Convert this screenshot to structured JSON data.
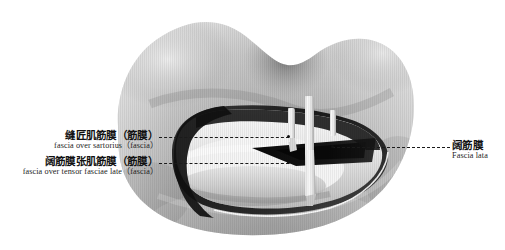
{
  "figure": {
    "type": "anatomical-illustration",
    "style": "grayscale photograph",
    "background_color": "#ffffff",
    "tone_dark": "#1d1d1d",
    "tone_mid": "#9a9a9a",
    "tone_light": "#e8e8e8",
    "retractor_count": 3,
    "has_surgical_opening": true
  },
  "labels": {
    "sartorius": {
      "cn": "缝匠肌筋膜（筋膜）",
      "en": "fascia over sartorius（fascia）",
      "side": "left"
    },
    "tensor_fasciae_latae": {
      "cn": "阔筋膜张肌筋膜（筋膜）",
      "en": "fascia over tensor fasciae late（fascia）",
      "side": "left"
    },
    "fascia_lata": {
      "cn": "阔筋膜",
      "en": "Fascia lata",
      "side": "right"
    }
  },
  "leaders": {
    "line_color": "#1a1a1a",
    "style": "dashed"
  }
}
